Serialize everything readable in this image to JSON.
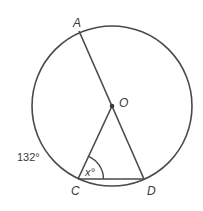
{
  "diagram": {
    "type": "circle-geometry",
    "colors": {
      "stroke": "#4a4a4a",
      "text": "#3a3a3a",
      "background": "#ffffff"
    },
    "circle": {
      "center_label": "O",
      "cx": 112,
      "cy": 106,
      "r": 80
    },
    "points": [
      {
        "id": "A",
        "label": "A",
        "x": 79,
        "y": 31
      },
      {
        "id": "O",
        "label": "O",
        "x": 112,
        "y": 106
      },
      {
        "id": "C",
        "label": "C",
        "x": 78,
        "y": 179
      },
      {
        "id": "D",
        "label": "D",
        "x": 144,
        "y": 179
      }
    ],
    "segments": [
      {
        "from": "A",
        "to": "D",
        "note": "diameter through O"
      },
      {
        "from": "O",
        "to": "C"
      },
      {
        "from": "C",
        "to": "D"
      }
    ],
    "angle_marker": {
      "vertex": "C",
      "label": "x°"
    },
    "arc_label": {
      "label": "132°",
      "arc": "AC"
    }
  }
}
